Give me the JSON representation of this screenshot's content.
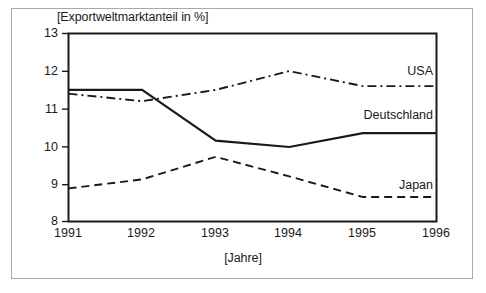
{
  "figure": {
    "frame_color": "#a9a9a9",
    "background": "#ffffff",
    "line_color": "#1a1a1a"
  },
  "chart_data": {
    "type": "line",
    "title": "",
    "ylabel": "[Exportweltmarktanteil in %]",
    "xlabel": "[Jahre]",
    "categories": [
      "1991",
      "1992",
      "1993",
      "1994",
      "1995",
      "1996"
    ],
    "x": [
      1991,
      1992,
      1993,
      1994,
      1995,
      1996
    ],
    "xlim": [
      1991,
      1996
    ],
    "ylim": [
      8,
      13
    ],
    "yticks": [
      "8",
      "9",
      "10",
      "11",
      "12",
      "13"
    ],
    "grid": false,
    "legend_position": "inline-right",
    "series": [
      {
        "name": "USA",
        "label": "USA",
        "style": "dash-dot",
        "color": "#1a1a1a",
        "values": [
          11.4,
          11.2,
          11.5,
          12.0,
          11.6,
          11.6
        ]
      },
      {
        "name": "Deutschland",
        "label": "Deutschland",
        "style": "solid",
        "color": "#1a1a1a",
        "values": [
          11.5,
          11.5,
          10.15,
          9.98,
          10.35,
          10.35
        ]
      },
      {
        "name": "Japan",
        "label": "Japan",
        "style": "dashed",
        "color": "#1a1a1a",
        "values": [
          8.88,
          9.12,
          9.72,
          9.2,
          8.65,
          8.65
        ]
      }
    ]
  },
  "labels": {
    "y_ticks": [
      {
        "text": "13"
      },
      {
        "text": "12"
      },
      {
        "text": "11"
      },
      {
        "text": "10"
      },
      {
        "text": "9"
      },
      {
        "text": "8"
      }
    ],
    "x_ticks": [
      {
        "text": "1991"
      },
      {
        "text": "1992"
      },
      {
        "text": "1993"
      },
      {
        "text": "1994"
      },
      {
        "text": "1995"
      },
      {
        "text": "1996"
      }
    ],
    "series_labels": [
      {
        "text": "USA"
      },
      {
        "text": "Deutschland"
      },
      {
        "text": "Japan"
      }
    ]
  }
}
